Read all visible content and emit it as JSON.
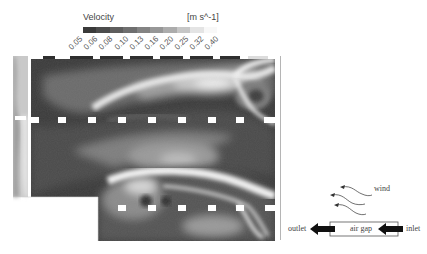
{
  "legend": {
    "title": "Velocity",
    "unit": "[m s^-1]",
    "ticks": [
      "0.05",
      "0.06",
      "0.08",
      "0.10",
      "0.13",
      "0.16",
      "0.20",
      "0.25",
      "0.32",
      "0.40"
    ],
    "colors": [
      "#3a3a3a",
      "#4c4c4c",
      "#5e5e5e",
      "#6f6f6f",
      "#838383",
      "#979797",
      "#acacac",
      "#c6c6c6",
      "#e4e4e4",
      "#f8f8f8"
    ]
  },
  "plot": {
    "description": "Velocity contour field of airflow through air gap (grayscale CFD)",
    "marker_rows": [
      {
        "y": 58,
        "label": "top row openings"
      },
      {
        "y": 120,
        "label": "middle row openings"
      },
      {
        "y": 208,
        "label": "bottom row openings"
      }
    ]
  },
  "schematic": {
    "wind_label": "wind",
    "outlet_label": "outlet",
    "air_gap_label": "air gap",
    "inlet_label": "inlet"
  }
}
